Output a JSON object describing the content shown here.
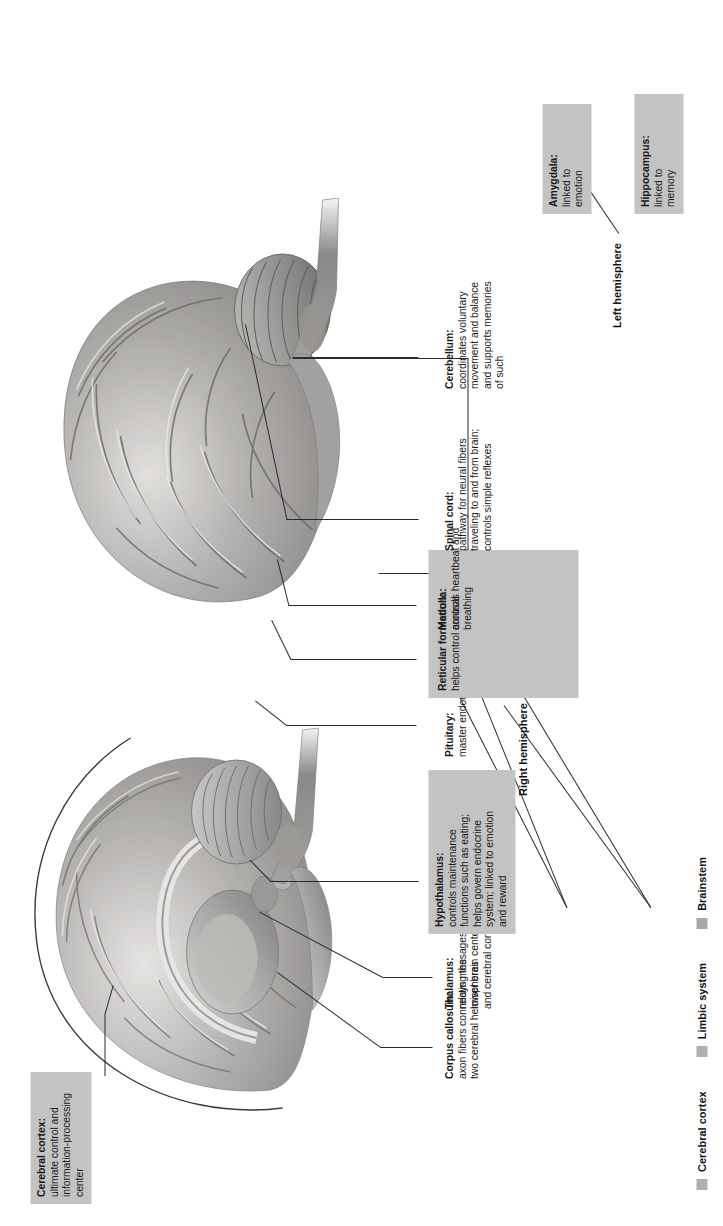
{
  "figure": {
    "type": "anatomical-diagram",
    "orientation": "rotated-90-ccw",
    "colors": {
      "label_shaded_background": "#c3c3c3",
      "leader_line": "#2b2b2b",
      "text": "#1a1a1a",
      "page_rule": "#6f6f6f",
      "legend_swatch": "#b0b0b0"
    }
  },
  "labels": {
    "cerebral_cortex": {
      "title": "Cerebral cortex:",
      "lines": [
        "ultimate control and",
        "information-processing",
        "center"
      ],
      "shaded": true
    },
    "corpus_callosum": {
      "title": "Corpus callosum:",
      "lines": [
        "axon fibers connecting the",
        "two cerebral hemispheres"
      ],
      "shaded": false
    },
    "thalamus": {
      "title": "Thalamus:",
      "lines": [
        "relays messages between",
        "lower brain centers",
        "and cerebral cortex"
      ],
      "shaded": false
    },
    "hypothalamus": {
      "title": "Hypothalamus:",
      "lines": [
        "controls maintenance",
        "functions such as eating;",
        "helps govern endocrine",
        "system; linked to emotion",
        "and reward"
      ],
      "shaded": true
    },
    "pituitary": {
      "title": "Pituitary:",
      "lines": [
        "master endocrine gland"
      ],
      "shaded": false
    },
    "reticular_formation": {
      "title": "Reticular formation:",
      "lines": [
        "helps control arousal"
      ],
      "shaded": true
    },
    "medulla": {
      "title": "Medulla:",
      "lines": [
        "controls heartbeat and",
        "breathing"
      ],
      "shaded": true
    },
    "spinal_cord": {
      "title": "Spinal cord:",
      "lines": [
        "pathway for neural fibers",
        "traveling to and from brain;",
        "controls simple reflexes"
      ],
      "shaded": false
    },
    "cerebellum": {
      "title": "Cerebellum:",
      "lines": [
        "coordinates voluntary",
        "movement and balance",
        "and supports memories",
        "of such"
      ],
      "shaded": false
    },
    "amygdala": {
      "title": "Amygdala:",
      "lines": [
        "linked to",
        "emotion"
      ],
      "shaded": true
    },
    "hippocampus": {
      "title": "Hippocampus:",
      "lines": [
        "linked to",
        "memory"
      ],
      "shaded": true
    }
  },
  "hemispheres": {
    "left": "Left hemisphere",
    "right": "Right hemisphere"
  },
  "legend": {
    "items": [
      {
        "label": "Cerebral cortex",
        "swatch": "#b0b0b0"
      },
      {
        "label": "Limbic system",
        "swatch": "#b0b0b0"
      },
      {
        "label": "Brainstem",
        "swatch": "#a8a8a8"
      }
    ]
  }
}
